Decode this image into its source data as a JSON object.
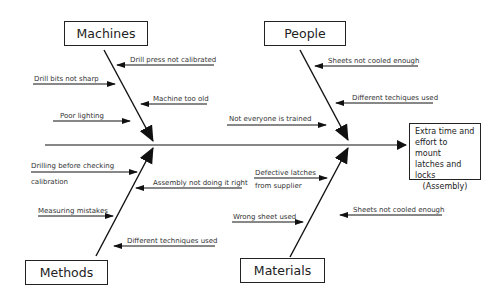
{
  "effect": {
    "lines": [
      "Extra time and",
      "effort to mount",
      "latches and locks"
    ],
    "sub": "(Assembly)"
  },
  "categories": {
    "machines": {
      "label": "Machines",
      "causes": [
        "Drill press not calibrated",
        "Drill bits not sharp",
        "Machine too old",
        "Poor lighting"
      ]
    },
    "people": {
      "label": "People",
      "causes": [
        "Sheets not cooled enough",
        "Different techiques used",
        "Not everyone is trained"
      ]
    },
    "methods": {
      "label": "Methods",
      "causes": [
        "Drilling before checking",
        "calibration",
        "Assembly not doing it right",
        "Measuring mistakes",
        "Different techniques used"
      ]
    },
    "materials": {
      "label": "Materials",
      "causes": [
        "Defective latches",
        "from supplier",
        "Wrong sheet used",
        "Sheets not cooled enough"
      ]
    }
  },
  "colors": {
    "line": "#1a1a1a",
    "background": "#ffffff"
  }
}
